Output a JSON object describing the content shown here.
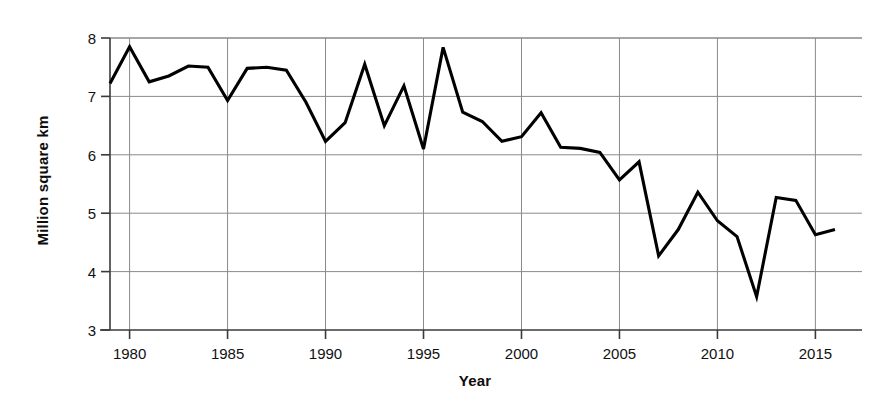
{
  "chart_data": {
    "type": "line",
    "title": "",
    "xlabel": "Year",
    "ylabel": "Million square km",
    "xlim": [
      1979,
      2016
    ],
    "ylim": [
      3,
      8
    ],
    "xticks": [
      1980,
      1985,
      1990,
      1995,
      2000,
      2005,
      2010,
      2015
    ],
    "xtick_labels": [
      "1980",
      "1985",
      "1990",
      "1995",
      "2000",
      "2005",
      "2010",
      "2015"
    ],
    "yticks": [
      3,
      4,
      5,
      6,
      7,
      8
    ],
    "ytick_labels": [
      "3",
      "4",
      "5",
      "6",
      "7",
      "8"
    ],
    "grid": true,
    "legend": "none",
    "line_color": "#000000",
    "grid_color": "#8a8a8a",
    "axis_color": "#3a3a3a",
    "x": [
      1979,
      1980,
      1981,
      1982,
      1983,
      1984,
      1985,
      1986,
      1987,
      1988,
      1989,
      1990,
      1991,
      1992,
      1993,
      1994,
      1995,
      1996,
      1997,
      1998,
      1999,
      2000,
      2001,
      2002,
      2003,
      2004,
      2005,
      2006,
      2007,
      2008,
      2009,
      2010,
      2011,
      2012,
      2013,
      2014,
      2015,
      2016
    ],
    "values": [
      7.22,
      7.85,
      7.25,
      7.35,
      7.52,
      7.5,
      6.93,
      7.48,
      7.5,
      7.45,
      6.9,
      6.23,
      6.55,
      7.55,
      6.5,
      7.18,
      6.1,
      7.84,
      6.73,
      6.57,
      6.23,
      6.31,
      6.72,
      6.13,
      6.11,
      6.04,
      5.57,
      5.88,
      4.27,
      4.72,
      5.36,
      4.87,
      4.6,
      3.57,
      5.27,
      5.22,
      4.63,
      4.72
    ],
    "series_name": "Minimum sea ice extent"
  },
  "axis_titles": {
    "x": "Year",
    "y": "Million square km"
  }
}
